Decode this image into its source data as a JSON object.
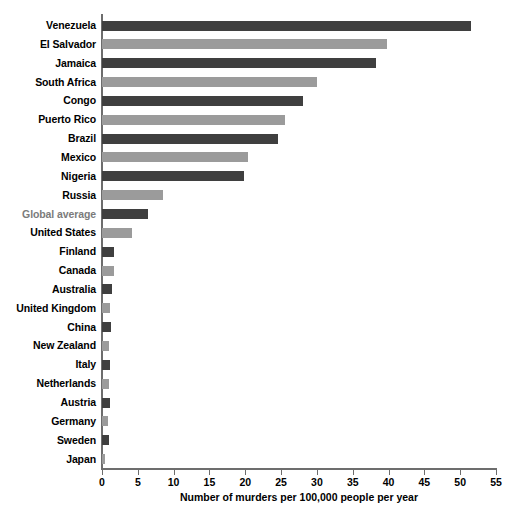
{
  "chart_data": {
    "type": "bar",
    "orientation": "horizontal",
    "title": "",
    "xlabel": "Number of murders per 100,000 people per year",
    "ylabel": "",
    "xlim": [
      0,
      55
    ],
    "xticks": [
      0,
      5,
      10,
      15,
      20,
      25,
      30,
      35,
      40,
      45,
      50,
      55
    ],
    "grid": false,
    "legend": "none",
    "colors": {
      "dark": "#3f3f3f",
      "light": "#9b9b9b",
      "axis": "#6d6d6d",
      "label": "#000000",
      "label_muted": "#7b7b7b"
    },
    "categories": [
      "Venezuela",
      "El Salvador",
      "Jamaica",
      "South Africa",
      "Congo",
      "Puerto Rico",
      "Brazil",
      "Mexico",
      "Nigeria",
      "Russia",
      "Global average",
      "United States",
      "Finland",
      "Canada",
      "Australia",
      "United Kingdom",
      "China",
      "New Zealand",
      "Italy",
      "Netherlands",
      "Austria",
      "Germany",
      "Sweden",
      "Japan"
    ],
    "values": [
      51.5,
      39.8,
      38.2,
      30.0,
      28.1,
      25.6,
      24.5,
      20.4,
      19.8,
      8.5,
      6.4,
      4.2,
      1.7,
      1.7,
      1.4,
      1.1,
      1.2,
      1.0,
      1.1,
      1.0,
      1.1,
      0.9,
      1.0,
      0.4
    ],
    "bar_styles": [
      "dark",
      "light",
      "dark",
      "light",
      "dark",
      "light",
      "dark",
      "light",
      "dark",
      "light",
      "dark",
      "light",
      "dark",
      "light",
      "dark",
      "light",
      "dark",
      "light",
      "dark",
      "light",
      "dark",
      "light",
      "dark",
      "light"
    ],
    "label_styles": [
      "normal",
      "normal",
      "normal",
      "normal",
      "normal",
      "normal",
      "normal",
      "normal",
      "normal",
      "normal",
      "muted",
      "normal",
      "normal",
      "normal",
      "normal",
      "normal",
      "normal",
      "normal",
      "normal",
      "normal",
      "normal",
      "normal",
      "normal",
      "normal"
    ]
  }
}
